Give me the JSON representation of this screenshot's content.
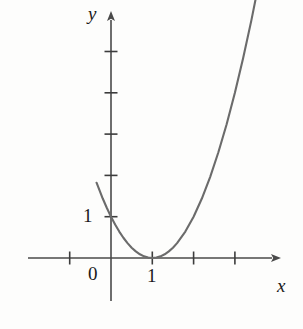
{
  "figure": {
    "background_color": "#fdfdfc",
    "curve_color": "#6b6b6b",
    "axis_color": "#4a4a4a",
    "text_color": "#1a1a1a"
  },
  "labels": {
    "y_axis": "y",
    "x_axis": "x",
    "origin": "0",
    "x_tick_one": "1",
    "y_tick_one": "1"
  },
  "chart_data": {
    "type": "line",
    "title": "",
    "xlabel": "x",
    "ylabel": "y",
    "equation": "y = (x - 1)^2",
    "vertex": [
      1,
      0
    ],
    "y_intercept": [
      0,
      1
    ],
    "xlim": [
      -1.35,
      4.4
    ],
    "ylim": [
      -1.05,
      6.2
    ],
    "grid": false,
    "legend": null,
    "axis_arrows": [
      "x-positive",
      "y-positive"
    ],
    "x_ticks": [
      -1,
      1,
      2,
      3
    ],
    "x_tick_labels": [
      "",
      "1",
      "",
      ""
    ],
    "y_ticks": [
      1,
      2,
      3,
      4,
      5
    ],
    "y_tick_labels": [
      "1",
      "",
      "",
      "",
      ""
    ],
    "origin_label": "0",
    "x": [
      -0.35,
      -0.2,
      -0.1,
      0.0,
      0.1,
      0.2,
      0.3,
      0.4,
      0.5,
      0.6,
      0.7,
      0.8,
      0.9,
      1.0,
      1.1,
      1.2,
      1.3,
      1.4,
      1.5,
      1.6,
      1.8,
      2.0,
      2.2,
      2.4,
      2.6,
      2.8,
      3.0,
      3.2,
      3.4,
      3.6
    ],
    "y": [
      1.8225,
      1.44,
      1.21,
      1.0,
      0.81,
      0.64,
      0.49,
      0.36,
      0.25,
      0.16,
      0.09,
      0.04,
      0.01,
      0.0,
      0.01,
      0.04,
      0.09,
      0.16,
      0.25,
      0.36,
      0.64,
      1.0,
      1.44,
      1.96,
      2.56,
      3.24,
      4.0,
      4.84,
      5.76,
      6.76
    ]
  },
  "geometry": {
    "origin_px": [
      111,
      258
    ],
    "unit_px": 41.3,
    "y_axis_top_px": 12,
    "y_axis_bottom_px": 301,
    "x_axis_left_px": 28,
    "x_axis_right_px": 279
  }
}
